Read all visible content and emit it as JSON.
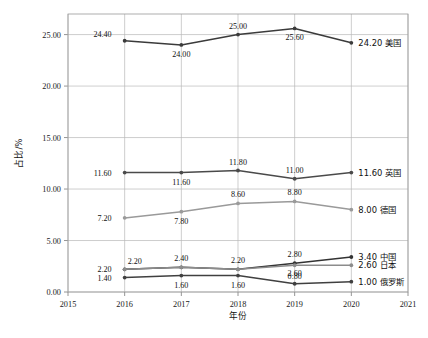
{
  "chart_data": {
    "type": "line",
    "title": "",
    "xlabel": "年份",
    "ylabel": "占比/%",
    "x": [
      2016,
      2017,
      2018,
      2019,
      2020
    ],
    "xticks": [
      "2015",
      "2016",
      "2017",
      "2018",
      "2019",
      "2020",
      "2021"
    ],
    "yticks": [
      "0.00",
      "5.00",
      "10.00",
      "15.00",
      "20.00",
      "25.00"
    ],
    "xlim": [
      2015,
      2021
    ],
    "ylim": [
      0.0,
      27.0
    ],
    "grid": true,
    "legend_position": "right-end-labels",
    "series": [
      {
        "name": "美国",
        "color": "#3b3b3b",
        "values": [
          24.4,
          24.0,
          25.0,
          25.6,
          24.2
        ],
        "labels": [
          "24.40",
          "24.00",
          "25.00",
          "25.60",
          "24.20"
        ],
        "end_label": "24.20  美国"
      },
      {
        "name": "英国",
        "color": "#4a4a4a",
        "values": [
          11.6,
          11.6,
          11.8,
          11.0,
          11.6
        ],
        "labels": [
          "11.60",
          "11.60",
          "11.80",
          "11.00",
          "11.60"
        ],
        "end_label": "11.60  英国"
      },
      {
        "name": "德国",
        "color": "#9a9a9a",
        "values": [
          7.2,
          7.8,
          8.6,
          8.8,
          8.0
        ],
        "labels": [
          "7.20",
          "7.80",
          "8.60",
          "8.80",
          "8.00"
        ],
        "end_label": "8.00  德国"
      },
      {
        "name": "中国",
        "color": "#333333",
        "values": [
          2.2,
          2.4,
          2.2,
          2.8,
          3.4
        ],
        "labels": [
          "2.20",
          "2.40",
          "2.20",
          "2.80",
          "3.40"
        ],
        "end_label": "3.40  中国"
      },
      {
        "name": "日本",
        "color": "#8c8c8c",
        "values": [
          2.2,
          2.4,
          2.2,
          2.6,
          2.6
        ],
        "labels": [
          "2.20",
          "2.40",
          "2.20",
          "2.60",
          "2.60"
        ],
        "end_label": "2.60  日本"
      },
      {
        "name": "俄罗斯",
        "color": "#404040",
        "values": [
          1.4,
          1.6,
          1.6,
          0.8,
          1.0
        ],
        "labels": [
          "1.40",
          "1.60",
          "1.60",
          "0.80",
          "1.00"
        ],
        "end_label": "1.00  俄罗斯"
      }
    ]
  }
}
